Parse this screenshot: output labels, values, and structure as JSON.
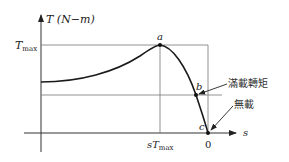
{
  "diagram": {
    "y_axis": {
      "label": "T (N−m)",
      "tick_label": "T",
      "tick_sub": "max"
    },
    "x_axis": {
      "label": "s",
      "origin_label": "0",
      "tick_label": "sT",
      "tick_sub": "max"
    },
    "points": [
      {
        "id": "a",
        "label": "a",
        "meaning": "maximum torque"
      },
      {
        "id": "b",
        "label": "b",
        "meaning": "rated (full-load) torque"
      },
      {
        "id": "c",
        "label": "c",
        "meaning": "no-load"
      }
    ],
    "annotations": [
      {
        "target": "b",
        "text": "滿載轉矩"
      },
      {
        "target": "c",
        "text": "無載"
      }
    ],
    "colors": {
      "curve": "#1a1a1a",
      "axis": "#333333",
      "guide": "#777777"
    }
  }
}
